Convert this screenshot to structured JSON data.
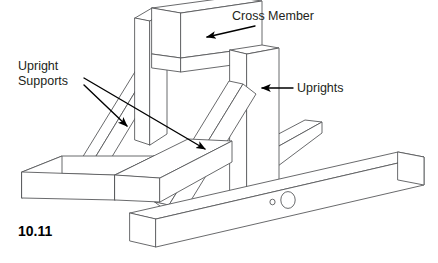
{
  "figure": {
    "number": "10.11",
    "background_color": "#ffffff",
    "line_color": "#58595b",
    "text_color": "#231f20"
  },
  "labels": [
    {
      "id": "cross-member",
      "text": "Cross Member",
      "x": 232,
      "y": 20,
      "anchor": "start",
      "leader": {
        "from_x": 255,
        "from_y": 26,
        "to_x": 207,
        "to_y": 37
      }
    },
    {
      "id": "upright-supports",
      "text_line1": "Upright",
      "text_line2": "Supports",
      "x": 18,
      "y": 70,
      "anchor": "start",
      "leaders": [
        {
          "from_x": 84,
          "from_y": 85,
          "to_x": 127,
          "to_y": 126
        },
        {
          "from_x": 84,
          "from_y": 78,
          "to_x": 205,
          "to_y": 149
        }
      ]
    },
    {
      "id": "uprights",
      "text": "Uprights",
      "x": 297,
      "y": 92,
      "anchor": "start",
      "leader": {
        "from_x": 292,
        "from_y": 88,
        "to_x": 262,
        "to_y": 88
      }
    }
  ],
  "parts": [
    {
      "name": "cross-member",
      "description": "horizontal beam spanning between the two uprights at the top"
    },
    {
      "name": "back-upright",
      "description": "vertical post at rear left of the cross member"
    },
    {
      "name": "front-upright",
      "description": "vertical post at front right of the cross member"
    },
    {
      "name": "back-upright-support",
      "description": "diagonal brace behind, running down to the left"
    },
    {
      "name": "front-upright-support",
      "description": "diagonal brace in front, running down to the left"
    },
    {
      "name": "left-base-beam",
      "description": "horizontal base beam extending left with square end cap"
    },
    {
      "name": "front-rail",
      "description": "long front horizontal rail with two drilled holes"
    },
    {
      "name": "back-rail",
      "description": "shorter rear horizontal rail"
    }
  ],
  "holes": [
    {
      "name": "small-hole",
      "cx": 272.5,
      "cy": 202,
      "rx": 2.6,
      "ry": 2.8
    },
    {
      "name": "large-hole",
      "cx": 288,
      "cy": 200,
      "rx": 7.2,
      "ry": 8.4
    }
  ]
}
